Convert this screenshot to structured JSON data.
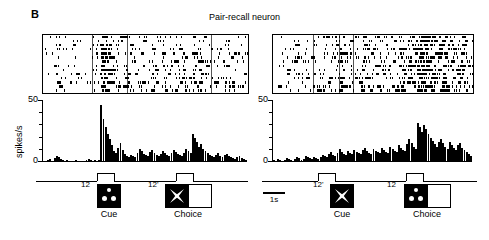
{
  "figure": {
    "panel_letter": "B",
    "title": "Pair-recall neuron",
    "scale_bar_label": "1s"
  },
  "axis": {
    "ylabel": "spikes/s",
    "tick_max": "50",
    "tick_zero": "0"
  },
  "panels": [
    {
      "id": "left",
      "cue_label": "12",
      "cue_caption": "Cue",
      "cue_icon": "three-dot-stimulus-icon",
      "choice_label": "12'",
      "choice_caption": "Choice",
      "choice_icon": "x-shape-stimulus-icon",
      "choice_has_blank": true
    },
    {
      "id": "right",
      "cue_label": "12'",
      "cue_caption": "Cue",
      "cue_icon": "x-shape-stimulus-icon",
      "choice_label": "12",
      "choice_caption": "Choice",
      "choice_icon": "three-dot-stimulus-icon",
      "choice_has_blank": true
    }
  ],
  "chart_data": {
    "type": "bar",
    "title": "Pair-recall neuron",
    "xlabel": "",
    "ylabel": "spikes/s",
    "ylim": [
      0,
      60
    ],
    "yticks_major": [
      0,
      50
    ],
    "yticks_minor": [
      10,
      20,
      30,
      40
    ],
    "grid": false,
    "legend": "none",
    "time_scale_seconds_per_bar_group": 1,
    "series": [
      {
        "name": "left-psth",
        "panel": "left",
        "cue_onset_bin": 27,
        "cue_offset_bin": 31,
        "choice_onset_bin": 70,
        "choice_offset_bin": 74,
        "values": [
          1,
          0,
          2,
          3,
          1,
          4,
          6,
          5,
          3,
          2,
          1,
          2,
          1,
          0,
          1,
          2,
          1,
          0,
          1,
          1,
          2,
          3,
          2,
          1,
          2,
          1,
          2,
          55,
          42,
          34,
          27,
          22,
          16,
          11,
          9,
          14,
          18,
          12,
          8,
          6,
          5,
          7,
          6,
          5,
          9,
          13,
          11,
          8,
          7,
          6,
          10,
          12,
          9,
          7,
          6,
          8,
          11,
          9,
          7,
          6,
          9,
          12,
          10,
          8,
          7,
          6,
          9,
          13,
          11,
          9,
          27,
          23,
          19,
          15,
          17,
          13,
          11,
          9,
          7,
          6,
          5,
          7,
          9,
          6,
          5,
          7,
          8,
          6,
          5,
          4,
          3,
          5,
          6,
          4,
          3,
          2
        ]
      },
      {
        "name": "right-psth",
        "panel": "right",
        "cue_onset_bin": 23,
        "cue_offset_bin": 27,
        "choice_onset_bin": 70,
        "choice_offset_bin": 74,
        "values": [
          2,
          1,
          3,
          2,
          1,
          2,
          4,
          3,
          2,
          1,
          3,
          5,
          4,
          2,
          3,
          6,
          5,
          4,
          3,
          5,
          4,
          3,
          5,
          7,
          6,
          5,
          8,
          10,
          7,
          6,
          9,
          13,
          10,
          8,
          7,
          11,
          9,
          8,
          12,
          10,
          9,
          8,
          12,
          14,
          11,
          9,
          8,
          13,
          11,
          10,
          9,
          14,
          12,
          10,
          9,
          15,
          13,
          11,
          10,
          16,
          14,
          12,
          11,
          17,
          22,
          18,
          15,
          13,
          38,
          34,
          29,
          36,
          32,
          27,
          23,
          20,
          17,
          15,
          19,
          22,
          18,
          15,
          13,
          19,
          16,
          14,
          12,
          16,
          18,
          14,
          12,
          10,
          8,
          6
        ]
      }
    ],
    "rasters": [
      {
        "panel": "left",
        "n_trials": 14,
        "event_lines": [
          0.24,
          0.41,
          0.82
        ],
        "density_profile": "sparse-before-cue, dense-burst-at-cue, sustained-moderate, moderate-at-choice"
      },
      {
        "panel": "right",
        "n_trials": 14,
        "event_lines": [
          0.2,
          0.33,
          0.4
        ],
        "density_profile": "sparse-before-cue, gradual-ramp, densest-near-choice"
      }
    ]
  }
}
